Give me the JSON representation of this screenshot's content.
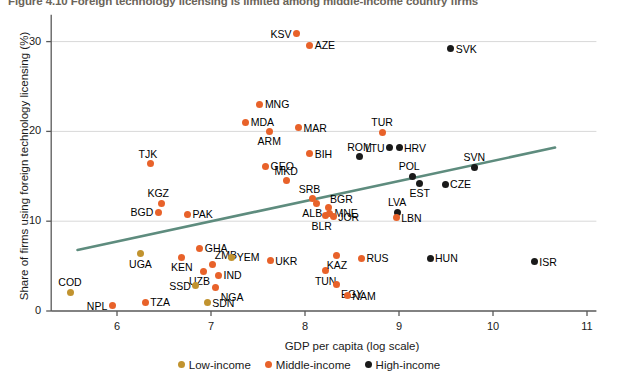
{
  "figure": {
    "title": "Figure 4.10  Foreign technology licensing is limited among middle-income country firms"
  },
  "chart_data": {
    "type": "scatter",
    "title": "Figure 4.10  Foreign technology licensing is limited among middle-income country firms",
    "xlabel": "GDP per capita (log scale)",
    "ylabel": "Share of firms using foreign technology licensing (%)",
    "xlim": [
      5.3,
      11.1
    ],
    "ylim": [
      -0.8,
      33
    ],
    "xticks": [
      6,
      7,
      8,
      9,
      10,
      11
    ],
    "yticks": [
      0,
      10,
      20,
      30
    ],
    "grid": "horizontal",
    "legend_position": "bottom",
    "colors": {
      "low_income": "#c1932f",
      "middle_income": "#e8622a",
      "high_income": "#1a1a1a",
      "trendline": "#5e8c7e",
      "gridline": "#d8d8d8",
      "axis": "#595959"
    },
    "legend": [
      {
        "label": "Low-income",
        "color": "#c1932f",
        "key": "low"
      },
      {
        "label": "Middle-income",
        "color": "#e8622a",
        "key": "mid"
      },
      {
        "label": "High-income",
        "color": "#1a1a1a",
        "key": "high"
      }
    ],
    "trendline": {
      "x0": 5.58,
      "y0": 6.8,
      "x1": 10.66,
      "y1": 18.2
    },
    "points": [
      {
        "code": "COD",
        "x": 5.5,
        "y": 2.1,
        "group": "low",
        "lbl": "above"
      },
      {
        "code": "NPL",
        "x": 5.95,
        "y": 0.6,
        "group": "mid",
        "lbl": "left"
      },
      {
        "code": "TZA",
        "x": 6.3,
        "y": 1.0,
        "group": "mid",
        "lbl": "right"
      },
      {
        "code": "UGA",
        "x": 6.25,
        "y": 6.4,
        "group": "low",
        "lbl": "below"
      },
      {
        "code": "TJK",
        "x": 6.36,
        "y": 16.4,
        "group": "mid",
        "lbl": "above-left"
      },
      {
        "code": "KGZ",
        "x": 6.47,
        "y": 12.0,
        "group": "mid",
        "lbl": "above-left"
      },
      {
        "code": "BGD",
        "x": 6.44,
        "y": 11.0,
        "group": "mid",
        "lbl": "left"
      },
      {
        "code": "PAK",
        "x": 6.75,
        "y": 10.8,
        "group": "mid",
        "lbl": "right"
      },
      {
        "code": "KEN",
        "x": 6.69,
        "y": 6.0,
        "group": "mid",
        "lbl": "below"
      },
      {
        "code": "GHA",
        "x": 6.88,
        "y": 7.0,
        "group": "mid",
        "lbl": "right"
      },
      {
        "code": "UZB",
        "x": 6.92,
        "y": 4.4,
        "group": "mid",
        "lbl": "below-left"
      },
      {
        "code": "SSD",
        "x": 6.84,
        "y": 2.8,
        "group": "low",
        "lbl": "left"
      },
      {
        "code": "SDN",
        "x": 6.96,
        "y": 0.9,
        "group": "low",
        "lbl": "right"
      },
      {
        "code": "ZMB",
        "x": 7.02,
        "y": 5.2,
        "group": "mid",
        "lbl": "above-right"
      },
      {
        "code": "IND",
        "x": 7.08,
        "y": 4.0,
        "group": "mid",
        "lbl": "right"
      },
      {
        "code": "NGA",
        "x": 7.05,
        "y": 2.6,
        "group": "mid",
        "lbl": "below-right"
      },
      {
        "code": "YEM",
        "x": 7.22,
        "y": 6.0,
        "group": "low",
        "lbl": "right"
      },
      {
        "code": "MDA",
        "x": 7.37,
        "y": 21.0,
        "group": "mid",
        "lbl": "right"
      },
      {
        "code": "MNG",
        "x": 7.52,
        "y": 23.0,
        "group": "mid",
        "lbl": "right"
      },
      {
        "code": "ARM",
        "x": 7.62,
        "y": 20.0,
        "group": "mid",
        "lbl": "below"
      },
      {
        "code": "GEO",
        "x": 7.58,
        "y": 16.1,
        "group": "mid",
        "lbl": "right"
      },
      {
        "code": "UKR",
        "x": 7.63,
        "y": 5.6,
        "group": "mid",
        "lbl": "right"
      },
      {
        "code": "MKD",
        "x": 7.8,
        "y": 14.5,
        "group": "mid",
        "lbl": "above"
      },
      {
        "code": "KSV",
        "x": 7.91,
        "y": 30.9,
        "group": "mid",
        "lbl": "left"
      },
      {
        "code": "MAR",
        "x": 7.93,
        "y": 20.4,
        "group": "mid",
        "lbl": "right"
      },
      {
        "code": "AZE",
        "x": 8.05,
        "y": 29.6,
        "group": "mid",
        "lbl": "right"
      },
      {
        "code": "BIH",
        "x": 8.05,
        "y": 17.5,
        "group": "mid",
        "lbl": "right"
      },
      {
        "code": "SRB",
        "x": 8.08,
        "y": 12.5,
        "group": "mid",
        "lbl": "above-left"
      },
      {
        "code": "ALB",
        "x": 8.12,
        "y": 12.0,
        "group": "mid",
        "lbl": "below-left"
      },
      {
        "code": "BLR",
        "x": 8.22,
        "y": 10.6,
        "group": "mid",
        "lbl": "below-left"
      },
      {
        "code": "BGR",
        "x": 8.25,
        "y": 11.5,
        "group": "mid",
        "lbl": "above-right"
      },
      {
        "code": "MNE",
        "x": 8.26,
        "y": 10.9,
        "group": "mid",
        "lbl": "right"
      },
      {
        "code": "JOR",
        "x": 8.3,
        "y": 10.5,
        "group": "mid",
        "lbl": "right"
      },
      {
        "code": "TUN",
        "x": 8.22,
        "y": 4.5,
        "group": "mid",
        "lbl": "below"
      },
      {
        "code": "EGY",
        "x": 8.33,
        "y": 2.9,
        "group": "mid",
        "lbl": "below-right"
      },
      {
        "code": "KAZ",
        "x": 8.34,
        "y": 6.2,
        "group": "mid",
        "lbl": "below"
      },
      {
        "code": "NAM",
        "x": 8.45,
        "y": 1.7,
        "group": "mid",
        "lbl": "right"
      },
      {
        "code": "ROM",
        "x": 8.58,
        "y": 17.2,
        "group": "high",
        "lbl": "above"
      },
      {
        "code": "RUS",
        "x": 8.6,
        "y": 5.9,
        "group": "mid",
        "lbl": "right"
      },
      {
        "code": "TUR",
        "x": 8.82,
        "y": 19.9,
        "group": "mid",
        "lbl": "above"
      },
      {
        "code": "LTU",
        "x": 8.9,
        "y": 18.2,
        "group": "high",
        "lbl": "left"
      },
      {
        "code": "HRV",
        "x": 9.0,
        "y": 18.2,
        "group": "high",
        "lbl": "right"
      },
      {
        "code": "LVA",
        "x": 8.98,
        "y": 11.0,
        "group": "high",
        "lbl": "above"
      },
      {
        "code": "LBN",
        "x": 8.97,
        "y": 10.4,
        "group": "mid",
        "lbl": "right"
      },
      {
        "code": "POL",
        "x": 9.14,
        "y": 15.0,
        "group": "high",
        "lbl": "above-left"
      },
      {
        "code": "EST",
        "x": 9.22,
        "y": 14.2,
        "group": "high",
        "lbl": "below"
      },
      {
        "code": "HUN",
        "x": 9.33,
        "y": 5.9,
        "group": "high",
        "lbl": "right"
      },
      {
        "code": "SVK",
        "x": 9.55,
        "y": 29.2,
        "group": "high",
        "lbl": "right"
      },
      {
        "code": "CZE",
        "x": 9.49,
        "y": 14.1,
        "group": "high",
        "lbl": "right"
      },
      {
        "code": "SVN",
        "x": 9.8,
        "y": 16.0,
        "group": "high",
        "lbl": "above"
      },
      {
        "code": "ISR",
        "x": 10.44,
        "y": 5.5,
        "group": "high",
        "lbl": "right"
      }
    ]
  }
}
